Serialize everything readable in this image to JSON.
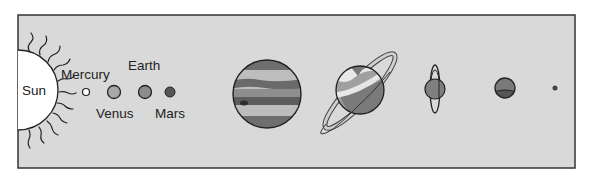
{
  "diagram": {
    "type": "solar-system-scale-diagram",
    "frame": {
      "x": 18,
      "y": 15,
      "width": 557,
      "height": 153,
      "fill": "#d9d9d9",
      "stroke": "#333333"
    },
    "labels": {
      "sun": "Sun",
      "mercury": "Mercury",
      "venus": "Venus",
      "earth": "Earth",
      "mars": "Mars"
    },
    "bodies": [
      {
        "name": "Sun",
        "icon": "sun-icon",
        "cx": 18,
        "cy": 90,
        "r": 40,
        "fill": "#ffffff"
      },
      {
        "name": "Mercury",
        "icon": "mercury-planet-icon",
        "cx": 86,
        "cy": 92,
        "r": 3.5,
        "fill": "#ffffff"
      },
      {
        "name": "Venus",
        "icon": "venus-planet-icon",
        "cx": 114,
        "cy": 92,
        "r": 6.5,
        "fill": "#a8a8a8"
      },
      {
        "name": "Earth",
        "icon": "earth-planet-icon",
        "cx": 145,
        "cy": 92,
        "r": 6.5,
        "fill": "#8c8c8c"
      },
      {
        "name": "Mars",
        "icon": "mars-planet-icon",
        "cx": 170,
        "cy": 92,
        "r": 5,
        "fill": "#555555"
      },
      {
        "name": "Jupiter",
        "icon": "jupiter-planet-icon",
        "cx": 267,
        "cy": 94,
        "r": 34,
        "fill": "#8a8a8a"
      },
      {
        "name": "Saturn",
        "icon": "saturn-planet-icon",
        "cx": 360,
        "cy": 90,
        "r": 24,
        "fill": "#9a9a9a"
      },
      {
        "name": "Uranus",
        "icon": "uranus-planet-icon",
        "cx": 435,
        "cy": 89,
        "r": 10,
        "fill": "#7f7f7f"
      },
      {
        "name": "Neptune",
        "icon": "neptune-planet-icon",
        "cx": 505,
        "cy": 88,
        "r": 10,
        "fill": "#707070"
      },
      {
        "name": "Pluto",
        "icon": "pluto-planet-icon",
        "cx": 555,
        "cy": 88,
        "r": 2.5,
        "fill": "#444444"
      }
    ]
  }
}
